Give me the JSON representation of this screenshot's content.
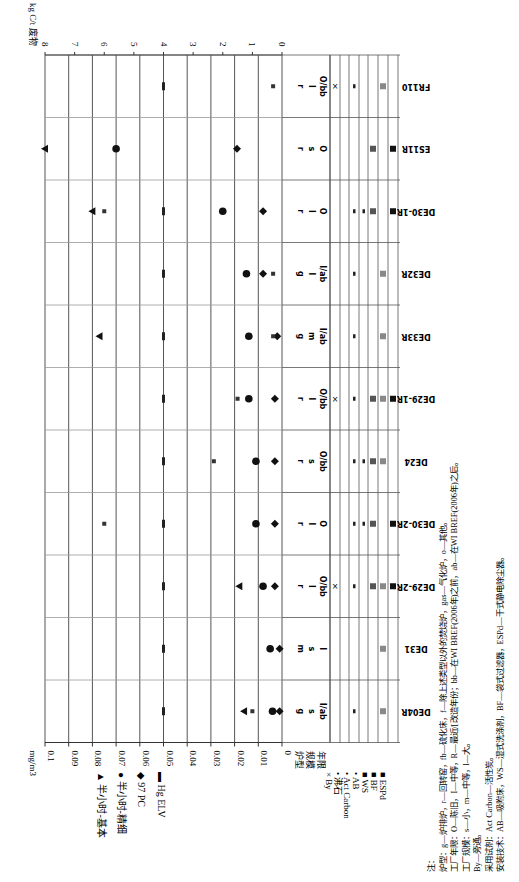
{
  "chart_data": {
    "type": "scatter",
    "orientation": "rotated-90-ccw",
    "title": "",
    "xlabel": "",
    "ylabel_primary": "mg/m³",
    "ylabel_secondary": "kg C/t 废物",
    "ylim_primary": [
      0,
      0.1
    ],
    "ylim_secondary": [
      0,
      8
    ],
    "primary_ticks": [
      "0.1",
      "0.09",
      "0.08",
      "0.07",
      "0.06",
      "0.05",
      "0.04",
      "0.03",
      "0.02",
      "0.01",
      "0"
    ],
    "secondary_ticks": [
      "8",
      "7",
      "6",
      "5",
      "4",
      "3",
      "2",
      "1",
      "0"
    ],
    "grid": true,
    "categories": [
      "DE04R",
      "DE31",
      "DE29-2R",
      "DE30-2R",
      "DE24",
      "DE29-1R",
      "DE33R",
      "DE32R",
      "DE30-1R",
      "ES11R",
      "FR110"
    ],
    "series": [
      {
        "name": "半小时-基本",
        "marker": "triangle",
        "values": [
          0.016,
          null,
          0.018,
          null,
          null,
          null,
          0.077,
          null,
          0.08,
          0.1,
          null
        ]
      },
      {
        "name": "半小时-精细",
        "marker": "circle",
        "values": [
          0.004,
          0.005,
          0.008,
          0.011,
          0.011,
          0.014,
          0.014,
          0.015,
          0.025,
          0.07,
          null
        ]
      },
      {
        "name": "97 PC",
        "marker": "diamond",
        "values": [
          0.001,
          0.001,
          0.003,
          0.003,
          0.003,
          0.003,
          0.002,
          0.008,
          0.008,
          0.019,
          null
        ]
      },
      {
        "name": "Hg ELV",
        "marker": "dash",
        "values": [
          0.05,
          0.05,
          0.05,
          0.05,
          0.05,
          0.05,
          0.05,
          0.05,
          0.05,
          null,
          0.05
        ]
      },
      {
        "name": "kg C/t 废物",
        "marker": "small-square",
        "axis": "secondary",
        "values": [
          1.0,
          null,
          null,
          6.0,
          2.3,
          1.5,
          0.3,
          0.3,
          6.0,
          null,
          0.3
        ]
      }
    ],
    "category_attributes": {
      "header": [
        "炉型",
        "规模",
        "年限"
      ],
      "DE04R": [
        "g",
        "s",
        "I/ab"
      ],
      "DE31": [
        "m",
        "s",
        "I"
      ],
      "DE29-2R": [
        "r",
        "l",
        "O/bb"
      ],
      "DE30-2R": [
        "r",
        "l",
        "O"
      ],
      "DE24": [
        "r",
        "s",
        "O/bb"
      ],
      "DE29-1R": [
        "r",
        "l",
        "O/bb"
      ],
      "DE33R": [
        "g",
        "m",
        "I/ab"
      ],
      "DE32R": [
        "g",
        "l",
        "I/ab"
      ],
      "DE30-1R": [
        "r",
        "l",
        "O"
      ],
      "ES11R": [
        "r",
        "s",
        "O"
      ],
      "FR110": [
        "r",
        "l",
        "O/bb"
      ]
    },
    "technology_matrix": {
      "rows": [
        "By",
        "沸石",
        "Act Carbon",
        "AB",
        "WS",
        "BF",
        "ESPd"
      ],
      "DE04R": [
        "",
        "",
        "•",
        "",
        "",
        "■",
        ""
      ],
      "DE31": [
        "",
        "",
        "",
        "",
        "",
        "■",
        ""
      ],
      "DE29-2R": [
        "×",
        "",
        "•",
        "",
        "■",
        "■",
        "■"
      ],
      "DE30-2R": [
        "",
        "",
        "•",
        "•",
        "■",
        "",
        "■"
      ],
      "DE24": [
        "",
        "",
        "•",
        "•",
        "■",
        "■",
        ""
      ],
      "DE29-1R": [
        "×",
        "",
        "•",
        "",
        "■",
        "■",
        "■"
      ],
      "DE33R": [
        "",
        "",
        "•",
        "",
        "",
        "■",
        ""
      ],
      "DE32R": [
        "",
        "",
        "•",
        "",
        "",
        "■",
        ""
      ],
      "DE30-1R": [
        "",
        "",
        "•",
        "•",
        "■",
        "",
        "■"
      ],
      "ES11R": [
        "",
        "",
        "",
        "",
        "■",
        "",
        "■"
      ],
      "FR110": [
        "×",
        "",
        "•",
        "",
        "",
        "■",
        ""
      ]
    }
  },
  "axis": {
    "left_unit": "mg/m",
    "left_unit_sup": "3",
    "right_unit": "kg C/t 废物",
    "attr_header": [
      "炉型",
      "规模",
      "年限"
    ]
  },
  "legend_series": [
    {
      "glyph": "▲",
      "label": "半小时-基本"
    },
    {
      "glyph": "●",
      "label": "半小时-精细"
    },
    {
      "glyph": "◆",
      "label": "97 PC"
    },
    {
      "glyph": "▬",
      "label": "Hg ELV"
    }
  ],
  "legend_tech": [
    {
      "glyph": "×",
      "label": "By"
    },
    {
      "glyph": "•",
      "label": "沸石"
    },
    {
      "glyph": "•",
      "label": "Act Carbon"
    },
    {
      "glyph": "•",
      "label": "AB"
    },
    {
      "glyph": "■",
      "label": "WS"
    },
    {
      "glyph": "■",
      "label": "BF"
    },
    {
      "glyph": "■",
      "label": "ESPd"
    }
  ],
  "notes": [
    "注：",
    "炉型：g—炉排炉，r—回转窑，fb—硫化床，f—除上述类型以外的焚烧炉，gas—气化炉，o—其他。",
    "工厂年限：O—陈旧，I—中等，R—最近/[改造年份；bb—在WI BREF(2006年)之前，ab—在WI BREF(2006年)之后。",
    "工厂规模：s—小，m—中等，l—大。",
    "By—旁通。",
    "采用试剂：Act Carbon—活性炭。",
    "安装技术：AB—吸附床，WS—湿式洗涤剂，BF—袋式过滤器，ESPd—干式静电除尘器。"
  ]
}
